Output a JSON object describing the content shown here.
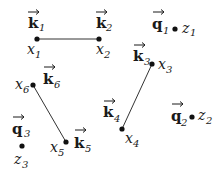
{
  "diagram": {
    "type": "point-pairing",
    "nodes": [
      {
        "id": "x1",
        "position_label": "x",
        "position_sub": "1",
        "vector_label": "k",
        "vector_sub": "1",
        "cx": 37,
        "cy": 39
      },
      {
        "id": "x2",
        "position_label": "x",
        "position_sub": "2",
        "vector_label": "k",
        "vector_sub": "2",
        "cx": 99,
        "cy": 39
      },
      {
        "id": "x3",
        "position_label": "x",
        "position_sub": "3",
        "vector_label": "k",
        "vector_sub": "3",
        "cx": 152,
        "cy": 64
      },
      {
        "id": "x4",
        "position_label": "x",
        "position_sub": "4",
        "vector_label": "k",
        "vector_sub": "4",
        "cx": 122,
        "cy": 129
      },
      {
        "id": "x5",
        "position_label": "x",
        "position_sub": "5",
        "vector_label": "k",
        "vector_sub": "5",
        "cx": 66,
        "cy": 142
      },
      {
        "id": "x6",
        "position_label": "x",
        "position_sub": "6",
        "vector_label": "k",
        "vector_sub": "6",
        "cx": 33,
        "cy": 85
      },
      {
        "id": "z1",
        "position_label": "z",
        "position_sub": "1",
        "vector_label": "q",
        "vector_sub": "1",
        "cx": 175,
        "cy": 29
      },
      {
        "id": "z2",
        "position_label": "z",
        "position_sub": "2",
        "vector_label": "q",
        "vector_sub": "2",
        "cx": 192,
        "cy": 117
      },
      {
        "id": "z3",
        "position_label": "z",
        "position_sub": "3",
        "vector_label": "q",
        "vector_sub": "3",
        "cx": 22,
        "cy": 146
      }
    ],
    "edges": [
      {
        "from": "x1",
        "to": "x2"
      },
      {
        "from": "x3",
        "to": "x4"
      },
      {
        "from": "x6",
        "to": "x5"
      }
    ]
  }
}
